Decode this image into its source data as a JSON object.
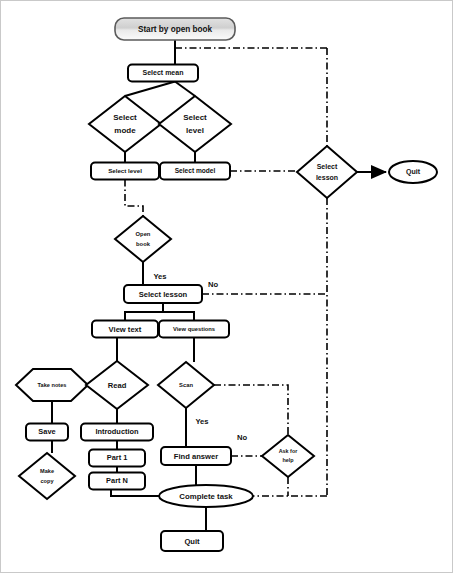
{
  "diagram": {
    "colors": {
      "stroke": "#000000",
      "node_fill": "#ffffff",
      "start_fill_top": "#d9d9d9",
      "start_fill_bottom": "#f7f7f7",
      "frame": "#c9c9c9",
      "text": "#111111"
    },
    "nodes": [
      {
        "id": "start",
        "label": "Start by open book",
        "shape": "rounded-rect-gradient",
        "x": 175,
        "y": 29,
        "w": 120,
        "h": 22
      },
      {
        "id": "select_mean",
        "label": "Select mean",
        "shape": "rounded-rect",
        "x": 163,
        "y": 73,
        "w": 70,
        "h": 17
      },
      {
        "id": "select_mode_d",
        "label": "Select mode",
        "shape": "diamond",
        "x": 125,
        "y": 124,
        "w": 72,
        "h": 56
      },
      {
        "id": "select_level_d",
        "label": "Select level",
        "shape": "diamond",
        "x": 195,
        "y": 124,
        "w": 72,
        "h": 56
      },
      {
        "id": "select_level_b",
        "label": "Select level",
        "shape": "rounded-rect",
        "x": 125,
        "y": 171,
        "w": 68,
        "h": 17
      },
      {
        "id": "select_model_b",
        "label": "Select model",
        "shape": "rounded-rect",
        "x": 195,
        "y": 171,
        "w": 70,
        "h": 17
      },
      {
        "id": "select_lesson_d",
        "label": "Select lesson",
        "shape": "diamond",
        "x": 327,
        "y": 172,
        "w": 60,
        "h": 52
      },
      {
        "id": "quit_right",
        "label": "Quit",
        "shape": "ellipse",
        "x": 413,
        "y": 172,
        "w": 48,
        "h": 22
      },
      {
        "id": "open_book",
        "label": "Open book",
        "shape": "diamond",
        "x": 143,
        "y": 239,
        "w": 56,
        "h": 46
      },
      {
        "id": "select_lesson_b",
        "label": "Select lesson",
        "shape": "rounded-rect",
        "x": 163,
        "y": 294,
        "w": 78,
        "h": 18
      },
      {
        "id": "view_text",
        "label": "View text",
        "shape": "rounded-rect",
        "x": 125,
        "y": 329,
        "w": 66,
        "h": 17
      },
      {
        "id": "view_questions",
        "label": "View questions",
        "shape": "rounded-rect",
        "x": 194,
        "y": 329,
        "w": 70,
        "h": 17
      },
      {
        "id": "take_notes",
        "label": "Take notes",
        "shape": "hexagon",
        "x": 52,
        "y": 385,
        "w": 72,
        "h": 32
      },
      {
        "id": "read",
        "label": "Read",
        "shape": "diamond",
        "x": 117,
        "y": 385,
        "w": 62,
        "h": 48
      },
      {
        "id": "scan",
        "label": "Scan",
        "shape": "diamond",
        "x": 186,
        "y": 385,
        "w": 56,
        "h": 46
      },
      {
        "id": "save",
        "label": "Save",
        "shape": "rounded-rect",
        "x": 47,
        "y": 432,
        "w": 42,
        "h": 17
      },
      {
        "id": "introduction",
        "label": "Introduction",
        "shape": "rounded-rect",
        "x": 117,
        "y": 432,
        "w": 72,
        "h": 17
      },
      {
        "id": "find_answer",
        "label": "Find answer",
        "shape": "rounded-rect",
        "x": 196,
        "y": 456,
        "w": 70,
        "h": 18
      },
      {
        "id": "ask_for_help",
        "label": "Ask for help",
        "shape": "diamond",
        "x": 288,
        "y": 456,
        "w": 52,
        "h": 42
      },
      {
        "id": "part_1",
        "label": "Part 1",
        "shape": "rounded-rect",
        "x": 117,
        "y": 458,
        "w": 56,
        "h": 17
      },
      {
        "id": "make_copy",
        "label": "Make copy",
        "shape": "diamond",
        "x": 47,
        "y": 476,
        "w": 56,
        "h": 46
      },
      {
        "id": "part_n",
        "label": "Part N",
        "shape": "rounded-rect",
        "x": 117,
        "y": 481,
        "w": 56,
        "h": 17
      },
      {
        "id": "complete_task",
        "label": "Complete task",
        "shape": "ellipse",
        "x": 206,
        "y": 496,
        "w": 94,
        "h": 22
      },
      {
        "id": "quit_bottom",
        "label": "Quit",
        "shape": "rounded-rect",
        "x": 192,
        "y": 541,
        "w": 62,
        "h": 20
      }
    ],
    "edge_labels": [
      {
        "id": "yes_open_book",
        "label": "Yes",
        "x": 160,
        "y": 277
      },
      {
        "id": "no_select_lesson",
        "label": "No",
        "x": 213,
        "y": 285
      },
      {
        "id": "yes_scan",
        "label": "Yes",
        "x": 200,
        "y": 422
      },
      {
        "id": "no_find_answer",
        "label": "No",
        "x": 242,
        "y": 438
      }
    ],
    "edges": [
      {
        "from": "start",
        "to": "select_mean",
        "style": "solid"
      },
      {
        "from": "start",
        "to": "select_lesson_d",
        "style": "dash-dot"
      },
      {
        "from": "select_mean",
        "to": "select_mode_d",
        "style": "solid"
      },
      {
        "from": "select_mean",
        "to": "select_level_d",
        "style": "solid"
      },
      {
        "from": "select_mode_d",
        "to": "select_level_b",
        "style": "solid"
      },
      {
        "from": "select_level_d",
        "to": "select_model_b",
        "style": "solid"
      },
      {
        "from": "select_model_b",
        "to": "select_lesson_d",
        "style": "dash-dot"
      },
      {
        "from": "select_lesson_d",
        "to": "quit_right",
        "style": "solid-arrow"
      },
      {
        "from": "select_level_b",
        "to": "open_book",
        "style": "dash-dot"
      },
      {
        "from": "open_book",
        "to": "select_lesson_b",
        "style": "solid",
        "label": "Yes"
      },
      {
        "from": "select_lesson_b",
        "to": "select_lesson_d",
        "style": "dash-dot",
        "label": "No"
      },
      {
        "from": "select_lesson_b",
        "to": "view_text",
        "style": "solid"
      },
      {
        "from": "select_lesson_b",
        "to": "view_questions",
        "style": "solid"
      },
      {
        "from": "view_text",
        "to": "read",
        "style": "solid"
      },
      {
        "from": "view_questions",
        "to": "scan",
        "style": "solid"
      },
      {
        "from": "read",
        "to": "take_notes",
        "style": "solid"
      },
      {
        "from": "read",
        "to": "introduction",
        "style": "solid"
      },
      {
        "from": "take_notes",
        "to": "save",
        "style": "solid"
      },
      {
        "from": "save",
        "to": "make_copy",
        "style": "solid"
      },
      {
        "from": "introduction",
        "to": "part_1",
        "style": "solid"
      },
      {
        "from": "part_1",
        "to": "part_n",
        "style": "solid"
      },
      {
        "from": "part_n",
        "to": "complete_task",
        "style": "solid"
      },
      {
        "from": "scan",
        "to": "find_answer",
        "style": "solid",
        "label": "Yes"
      },
      {
        "from": "scan",
        "to": "ask_for_help",
        "style": "dash-dot"
      },
      {
        "from": "find_answer",
        "to": "ask_for_help",
        "style": "dash-dot",
        "label": "No"
      },
      {
        "from": "find_answer",
        "to": "complete_task",
        "style": "solid"
      },
      {
        "from": "ask_for_help",
        "to": "complete_task",
        "style": "dash-dot"
      },
      {
        "from": "complete_task",
        "to": "quit_bottom",
        "style": "solid"
      }
    ]
  }
}
